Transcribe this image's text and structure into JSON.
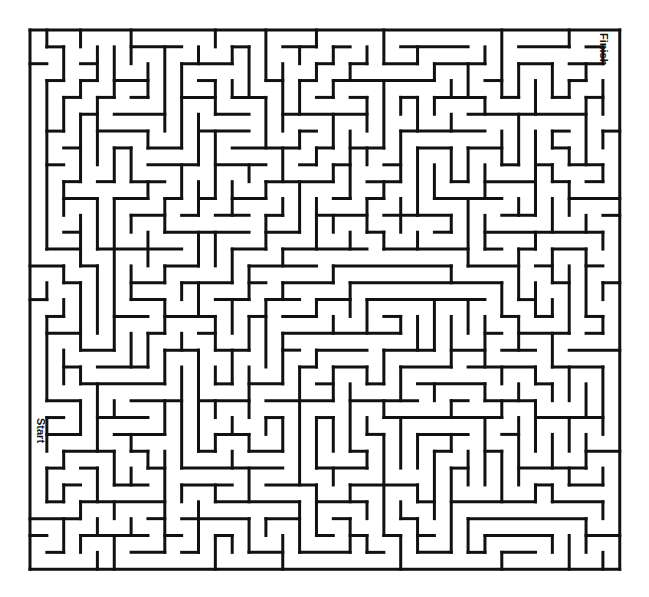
{
  "figure": {
    "kind": "maze-puzzle",
    "background_color": "#ffffff",
    "wall_color": "#111111",
    "start_label": "Start",
    "finish_label": "Finish"
  },
  "maze": {
    "cols": 35,
    "rows": 32,
    "cell_size": 16.85,
    "origin_x": 30,
    "origin_y": 30,
    "wall_thickness": 3,
    "border_thickness": 3,
    "start_cell": [
      0,
      23
    ],
    "finish_cell": [
      34,
      0
    ],
    "start_label": "Start",
    "finish_label": "Finish",
    "h_walls": [
      "11111111111111111111111111111111111",
      "00010001000101010100010000101000001",
      "01000100100010001000100001000100100",
      "00101010001000010101001010010010010",
      "01010001010100101000100100100101001",
      "00100100100010010101010010011000100",
      "01001011001001000010001001000100010",
      "10100100010110010100100100101001001",
      "00011001001001001001010010010010100",
      "01100010100100100100101001001001010",
      "10010100011001001010010010100100101",
      "00101001100100110001001001001011010",
      "01010010010011001010100100100100101",
      "10100101001000100101001011010010010",
      "00011010100101001010010100101001001",
      "01100100011010100100101001010100100",
      "10010011100100011001010010101010010",
      "00101100010011000110100101010001001",
      "11010010101000101001011010001100100",
      "00100101010110010100100101010010011",
      "01011010100001101001001010100101100",
      "10100100011010010010100101001010010",
      "01001011000101100101010010100100101",
      "00110100101010001010101001011001010",
      "10001001010100110100010110100100101",
      "01010110001001001001101001001011010",
      "00101001010010110010010100110100100",
      "11010010101001001101001011001001011",
      "00100101010110100010110100100110100",
      "01011010001001011001001001011001001",
      "10100100110100100110010110100100110",
      "01001011001011001001101001011011001",
      "11111111111111111111111111111111111"
    ],
    "v_walls": [
      "100010001000100010001000100010001000",
      "101000100010001000100010001000100001",
      "100100010001000100010001000100010001",
      "100010001000100010001000100010001001",
      "100100010001000100010001000100010001",
      "101000100010001000100010001000100001",
      "100010001000100010001000100010001001",
      "100100010001000100010001000100010001",
      "101000100010001000100010001000100001",
      "100010001000100010001000100010001001",
      "100100010001000100010001000100010001",
      "101000100010001000100010001000100001",
      "100010001000100010001000100010001001",
      "100100010001000100010001000100010001",
      "101000100010001000100010001000100001",
      "100010001000100010001000100010001001",
      "100100010001000100010001000100010001",
      "101000100010001000100010001000100001",
      "100010001000100010001000100010001001",
      "100100010001000100010001000100010001",
      "101000100010001000100010001000100001",
      "100010001000100010001000100010001001",
      "100100010001000100010001000100010001",
      "101000100010001000100010001000100001",
      "100010001000100010001000100010001001",
      "100100010001000100010001000100010001",
      "101000100010001000100010001000100001",
      "100010001000100010001000100010001001",
      "100100010001000100010001000100010001",
      "101000100010001000100010001000100001",
      "100010001000100010001000100010001001",
      "100100010001000100010001000100010001"
    ]
  }
}
